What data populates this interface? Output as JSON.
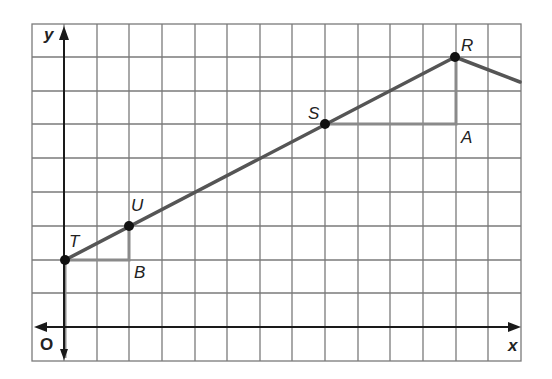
{
  "diagram": {
    "type": "coordinate-grid",
    "grid": {
      "columns": 15,
      "rows": 10,
      "line_color": "#7a7a7a"
    },
    "axes": {
      "x_label": "x",
      "y_label": "y",
      "origin_label": "O",
      "color": "#1a1a1a"
    },
    "line_color": "#555555",
    "points": [
      {
        "label": "T",
        "x": 0,
        "y": 2
      },
      {
        "label": "U",
        "x": 2,
        "y": 3
      },
      {
        "label": "S",
        "x": 8,
        "y": 6
      },
      {
        "label": "R",
        "x": 12,
        "y": 8
      }
    ],
    "triangle_corners": [
      {
        "label": "B",
        "x": 2,
        "y": 2
      },
      {
        "label": "A",
        "x": 12,
        "y": 6
      }
    ],
    "descending_segment_end": {
      "x": 14,
      "y": 7.3
    }
  }
}
